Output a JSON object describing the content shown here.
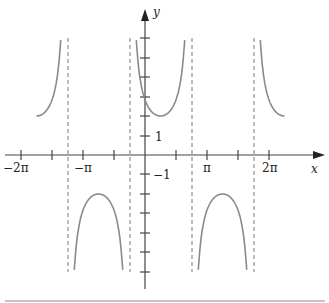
{
  "chart_data": {
    "type": "line",
    "title": "",
    "function": "y = 2 sec(x - pi/4)",
    "xlabel": "x",
    "ylabel": "y",
    "x_tick_labels": [
      "-2π",
      "-π",
      "π",
      "2π"
    ],
    "x_ticks": [
      "-2π",
      "-3π/2",
      "-π",
      "-π/2",
      "π/2",
      "π",
      "3π/2",
      "2π"
    ],
    "y_tick_labels": [
      "1",
      "-1"
    ],
    "y_ticks": [
      -6,
      -5,
      -4,
      -3,
      -2,
      -1,
      1,
      2,
      3,
      4,
      5,
      6
    ],
    "asymptotes": [
      "-5π/4",
      "-π/4",
      "3π/4",
      "7π/4"
    ],
    "xlim": [
      "-2π",
      "2π"
    ],
    "ylim": [
      -6,
      6
    ],
    "grid": false,
    "series": [
      {
        "name": "branch-left-upper",
        "x_range": [
          "-7π/4",
          "-5π/4"
        ],
        "min_point": [
          "-7π/4",
          2
        ]
      },
      {
        "name": "branch-left-lower",
        "x_range": [
          "-5π/4",
          "-π/4"
        ],
        "max_point": [
          "-3π/4",
          -2
        ]
      },
      {
        "name": "branch-center-upper",
        "x_range": [
          "-π/4",
          "3π/4"
        ],
        "min_point": [
          "π/4",
          2
        ]
      },
      {
        "name": "branch-right-lower",
        "x_range": [
          "3π/4",
          "7π/4"
        ],
        "max_point": [
          "5π/4",
          -2
        ]
      },
      {
        "name": "branch-right-upper",
        "x_range": [
          "7π/4",
          "9π/4"
        ],
        "min_point": [
          "9π/4",
          2
        ]
      }
    ]
  },
  "labels": {
    "x_axis": "x",
    "y_axis": "y",
    "neg_two_pi": "−2π",
    "neg_pi": "−π",
    "pi": "π",
    "two_pi": "2π",
    "one": "1",
    "neg_one": "−1"
  },
  "colors": {
    "curve": "#8a8a8a",
    "axis": "#333333",
    "asymptote": "#777777",
    "rule": "#bbbbbb"
  }
}
